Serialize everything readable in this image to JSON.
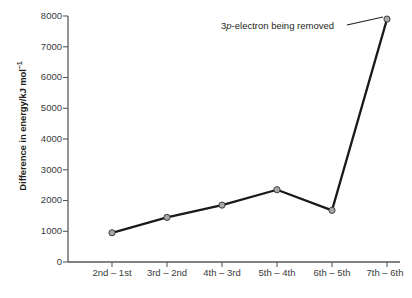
{
  "chart_data": {
    "type": "line",
    "title": "",
    "xlabel": "",
    "ylabel": "Difference in energy/kJ mol",
    "ylabel_exponent": "−1",
    "categories": [
      "2nd – 1st",
      "3rd – 2nd",
      "4th – 3rd",
      "5th – 4th",
      "6th – 5th",
      "7th – 6th"
    ],
    "values": [
      950,
      1450,
      1850,
      2350,
      1680,
      7900
    ],
    "ylim": [
      0,
      8000
    ],
    "yticks": [
      0,
      1000,
      2000,
      3000,
      4000,
      5000,
      6000,
      7000,
      8000
    ],
    "ytick_labels": [
      "0",
      "1000",
      "2000",
      "3000",
      "4000",
      "5000",
      "6000",
      "7000",
      "8000"
    ],
    "grid": false,
    "legend": false,
    "annotations": [
      {
        "text_before": "3",
        "text_italic": "p",
        "text_after": "-electron being removed",
        "full_text": "3p-electron being removed",
        "points_to_category": "7th – 6th",
        "points_to_value": 7900
      }
    ],
    "colors": {
      "line": "#1a1a1a",
      "marker_fill": "#a8a8a8",
      "marker_edge": "#3d3d3d",
      "axis": "#58595b",
      "text": "#231f20"
    }
  }
}
